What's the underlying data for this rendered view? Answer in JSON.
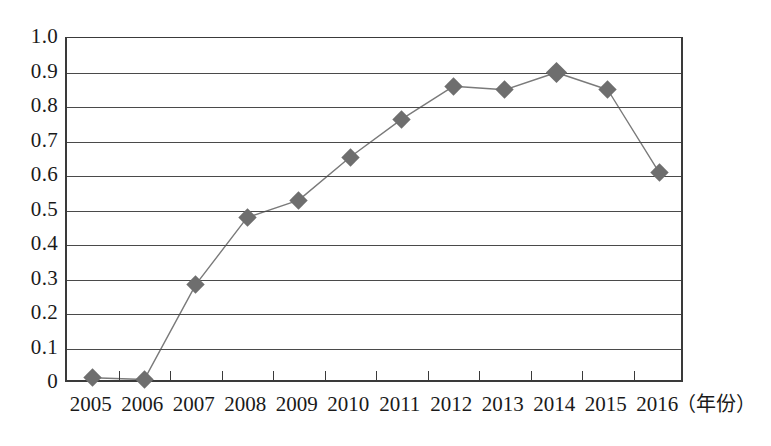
{
  "chart_data": {
    "type": "line",
    "title": "",
    "xlabel": "（年份）",
    "ylabel": "",
    "categories": [
      "2005",
      "2006",
      "2007",
      "2008",
      "2009",
      "2010",
      "2011",
      "2012",
      "2013",
      "2014",
      "2015",
      "2016"
    ],
    "values": [
      0.015,
      0.01,
      0.285,
      0.48,
      0.53,
      0.655,
      0.765,
      0.86,
      0.85,
      0.9,
      0.85,
      0.61
    ],
    "series": [
      {
        "name": "series-1",
        "values": [
          0.015,
          0.01,
          0.285,
          0.48,
          0.53,
          0.655,
          0.765,
          0.86,
          0.85,
          0.9,
          0.85,
          0.61
        ]
      }
    ],
    "ylim": [
      0,
      1.0
    ],
    "ytick_labels": [
      "1.0",
      "0.9",
      "0.8",
      "0.7",
      "0.6",
      "0.5",
      "0.4",
      "0.3",
      "0.2",
      "0.1",
      "0"
    ],
    "ytick_values": [
      1.0,
      0.9,
      0.8,
      0.7,
      0.6,
      0.5,
      0.4,
      0.3,
      0.2,
      0.1,
      0
    ],
    "grid": true,
    "legend": "none",
    "marker": "diamond",
    "marker_color": "#6e6e6e",
    "line_color": "#7a7a7a",
    "axis_color": "#3a3a3a",
    "background": "#ffffff"
  }
}
